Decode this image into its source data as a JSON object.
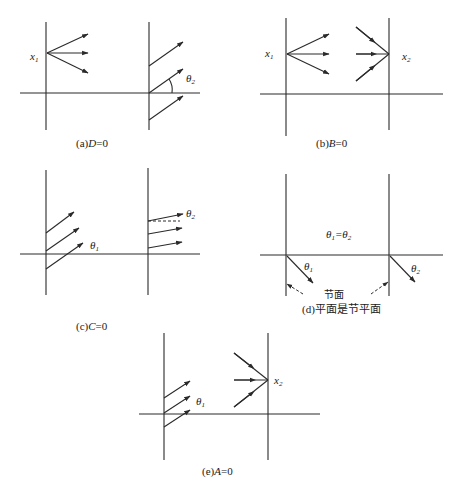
{
  "panels": {
    "a": {
      "caption_prefix": "(a)",
      "caption_var": "D",
      "caption_suffix": "=0",
      "label_x": "x",
      "label_x_sub": "1",
      "label_theta": "θ",
      "label_theta_sub": "2"
    },
    "b": {
      "caption_prefix": "(b)",
      "caption_var": "B",
      "caption_suffix": "=0",
      "label_x1": "x",
      "label_x1_sub": "1",
      "label_x2": "x",
      "label_x2_sub": "2"
    },
    "c": {
      "caption_prefix": "(c)",
      "caption_var": "C",
      "caption_suffix": "=0",
      "label_theta1": "θ",
      "label_theta1_sub": "1",
      "label_theta2": "θ",
      "label_theta2_sub": "2"
    },
    "d": {
      "caption": "(d)平面是节平面",
      "node_label": "节面",
      "equation": "θ",
      "eq_sub1": "1",
      "eq_mid": "=θ",
      "eq_sub2": "2",
      "label_theta1": "θ",
      "label_theta1_sub": "1",
      "label_theta2": "θ",
      "label_theta2_sub": "2"
    },
    "e": {
      "caption_prefix": "(e)",
      "caption_var": "A",
      "caption_suffix": "=0",
      "label_theta1": "θ",
      "label_theta1_sub": "1",
      "label_x2": "x",
      "label_x2_sub": "2"
    }
  }
}
